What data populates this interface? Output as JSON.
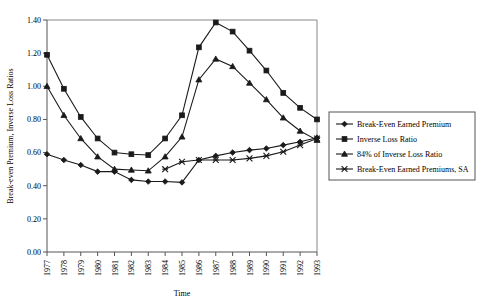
{
  "chart_data": {
    "type": "line",
    "title": "",
    "xlabel": "Time",
    "ylabel": "Break-even Premium, Inverse Loss Ratios",
    "xlim": [
      1977,
      1993
    ],
    "ylim": [
      0.0,
      1.4
    ],
    "ytick_step": 0.2,
    "grid": false,
    "legend_position": "right",
    "categories": [
      1977,
      1978,
      1979,
      1980,
      1981,
      1982,
      1983,
      1984,
      1985,
      1986,
      1987,
      1988,
      1989,
      1990,
      1991,
      1992,
      1993
    ],
    "x_tick_labels": [
      "1977",
      "1978",
      "1979",
      "1980",
      "1981",
      "1982",
      "1983",
      "1984",
      "1985",
      "1986",
      "1987",
      "1988",
      "1989",
      "1990",
      "1991",
      "1992",
      "1993"
    ],
    "y_tick_labels": [
      "0.00",
      "0.20",
      "0.40",
      "0.60",
      "0.80",
      "1.00",
      "1.20",
      "1.40"
    ],
    "y_tick_values": [
      0.0,
      0.2,
      0.4,
      0.6,
      0.8,
      1.0,
      1.2,
      1.4
    ],
    "series": [
      {
        "name": "Break-Even Earned Premium",
        "marker": "diamond",
        "values": [
          0.59,
          0.555,
          0.525,
          0.485,
          0.485,
          0.435,
          0.425,
          0.425,
          0.42,
          0.555,
          0.58,
          0.6,
          0.615,
          0.625,
          0.645,
          0.665,
          0.69
        ]
      },
      {
        "name": "Inverse Loss Ratio",
        "marker": "square",
        "values": [
          1.19,
          0.985,
          0.815,
          0.685,
          0.6,
          0.59,
          0.585,
          0.685,
          0.825,
          1.235,
          1.385,
          1.33,
          1.215,
          1.095,
          0.96,
          0.87,
          0.8
        ]
      },
      {
        "name": "84% of Inverse Loss Ratio",
        "marker": "triangle",
        "values": [
          1.0,
          0.825,
          0.685,
          0.575,
          0.5,
          0.495,
          0.49,
          0.575,
          0.695,
          1.04,
          1.165,
          1.12,
          1.02,
          0.92,
          0.81,
          0.73,
          0.675
        ]
      },
      {
        "name": "Break-Even Earned Premiums, SA",
        "marker": "cross",
        "values": [
          null,
          null,
          null,
          null,
          null,
          null,
          null,
          0.5,
          0.545,
          0.555,
          0.555,
          0.555,
          0.565,
          0.58,
          0.605,
          0.645,
          0.685
        ]
      }
    ],
    "legend": [
      {
        "label": "Break-Even Earned Premium",
        "marker": "diamond"
      },
      {
        "label": "Inverse Loss Ratio",
        "marker": "square"
      },
      {
        "label": "84% of Inverse Loss Ratio",
        "marker": "triangle"
      },
      {
        "label": "Break-Even Earned Premiums, SA",
        "marker": "cross"
      }
    ],
    "colors": {
      "series": "#1a1a1a",
      "axis": "#555555",
      "frame": "#888888",
      "background": "#ffffff"
    }
  }
}
